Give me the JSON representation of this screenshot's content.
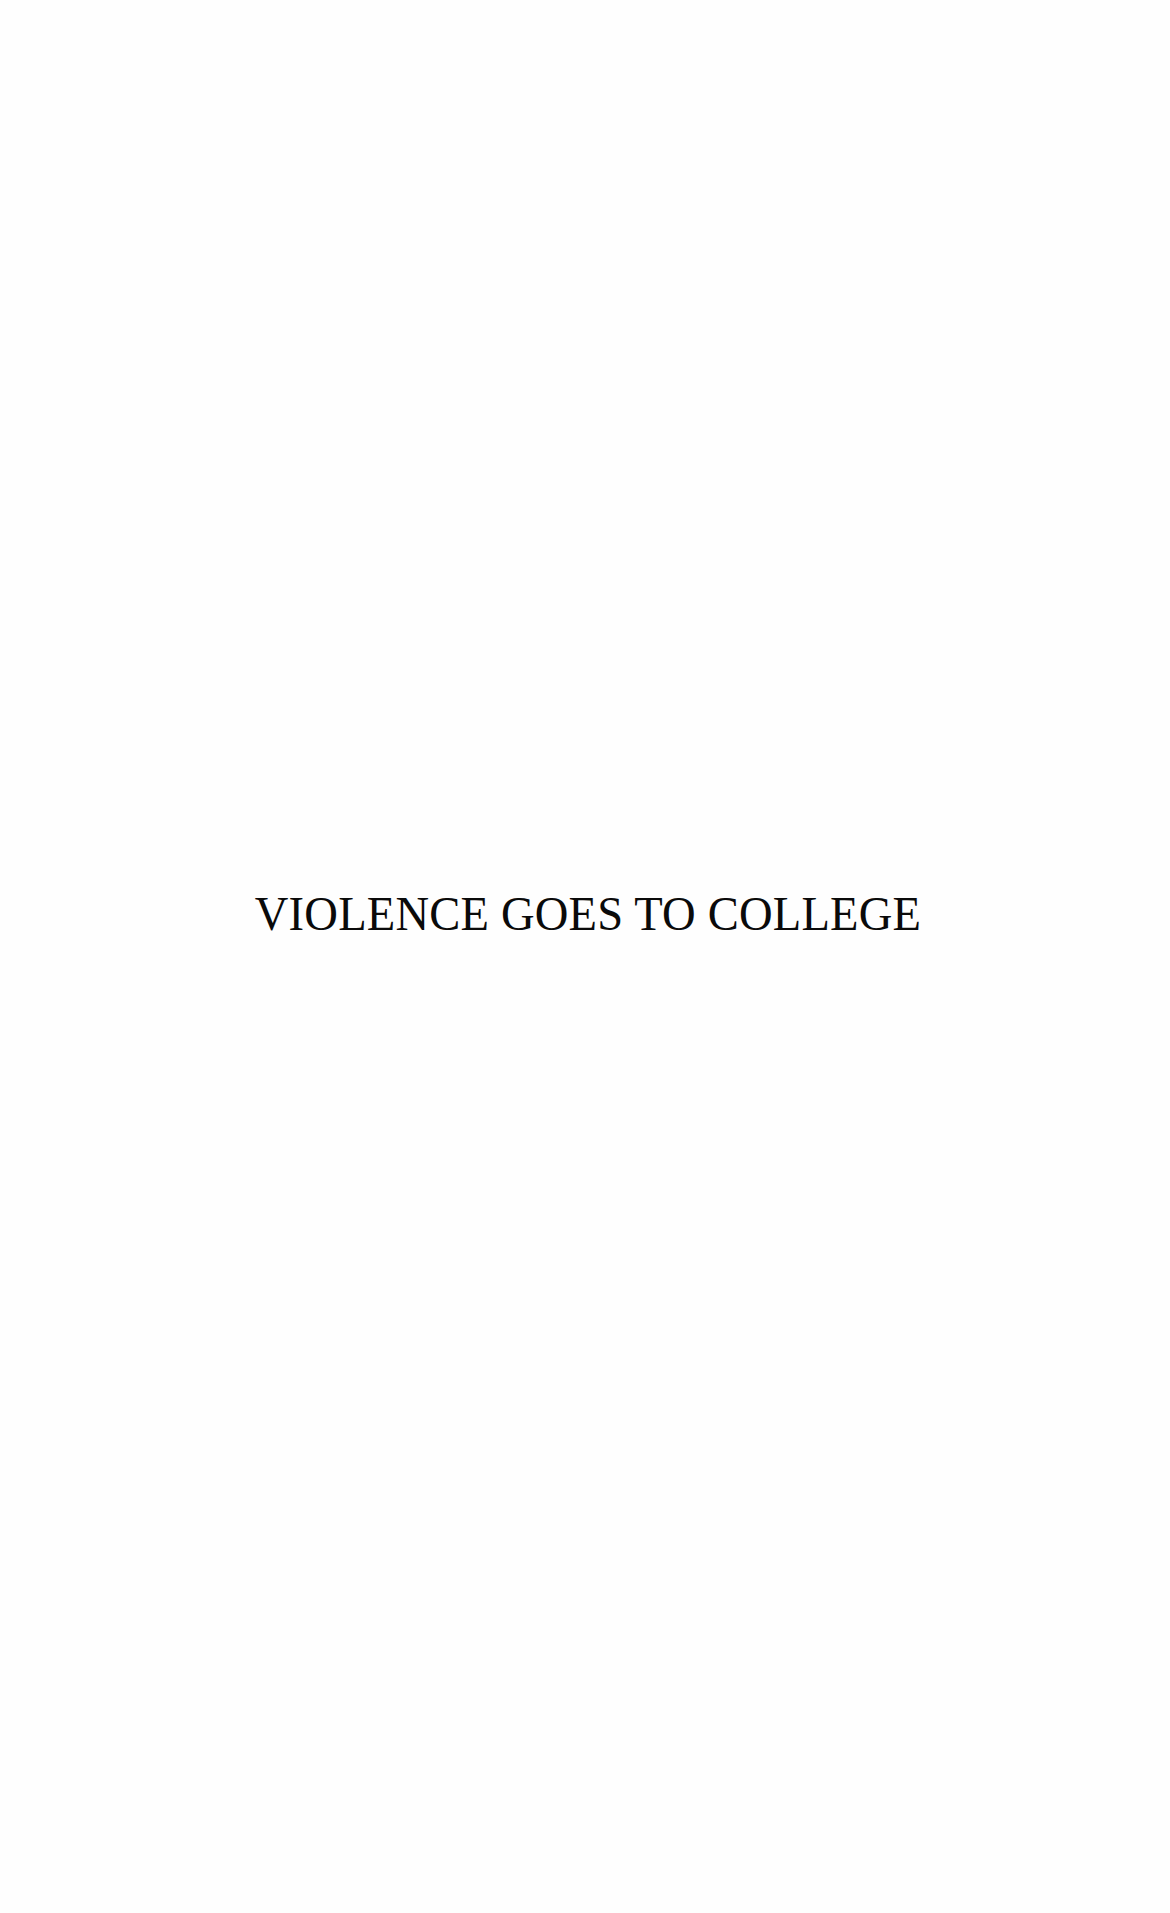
{
  "page": {
    "type": "half-title page",
    "title": "VIOLENCE GOES TO COLLEGE",
    "colors": {
      "background": "#fefefe",
      "text": "#0a0a0a"
    }
  }
}
